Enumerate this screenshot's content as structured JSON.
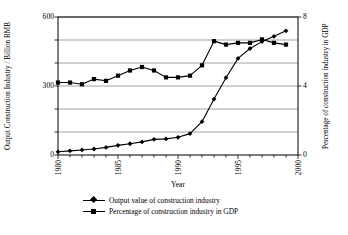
{
  "chart_data": {
    "type": "line",
    "title": "",
    "xlabel": "Year",
    "ylabel": "Output Construction Industry / Billion RMB",
    "ylabel_right": "Percentage of construction industry in GDP",
    "grid": true,
    "legend_position": "bottom",
    "xlim": [
      1980,
      2000
    ],
    "xticks": [
      1980,
      1985,
      1990,
      1995,
      2000
    ],
    "xtick_labels": [
      "1980",
      "1985",
      "1990",
      "1995",
      "2000"
    ],
    "ylim": [
      0,
      600
    ],
    "yticks": [
      0,
      100,
      200,
      300,
      400,
      500,
      600
    ],
    "ytick_labels": [
      "0",
      "",
      "",
      "300",
      "",
      "",
      "600"
    ],
    "ylim_right": [
      0,
      8
    ],
    "yticks_right": [
      0,
      4,
      8
    ],
    "ytick_labels_right": [
      "0",
      "4",
      "8"
    ],
    "x": [
      1980,
      1981,
      1982,
      1983,
      1984,
      1985,
      1986,
      1987,
      1988,
      1989,
      1990,
      1991,
      1992,
      1993,
      1994,
      1995,
      1996,
      1997,
      1998,
      1999
    ],
    "series": [
      {
        "name": "Output value of construction industry",
        "axis": "left",
        "marker": "diamond",
        "units": "Billion RMB",
        "values": [
          14,
          18,
          22,
          26,
          33,
          42,
          49,
          57,
          68,
          70,
          77,
          93,
          145,
          243,
          336,
          420,
          463,
          493,
          516,
          540
        ]
      },
      {
        "name": "Percentage of construction industry in GDP",
        "axis": "right",
        "marker": "square",
        "units": "percent",
        "values": [
          4.2,
          4.2,
          4.1,
          4.4,
          4.3,
          4.6,
          4.9,
          5.1,
          4.9,
          4.5,
          4.5,
          4.6,
          5.2,
          6.6,
          6.4,
          6.5,
          6.5,
          6.7,
          6.5,
          6.4
        ]
      }
    ],
    "legend": [
      "Output value of construction industry",
      "Percentage of construction industry in GDP"
    ]
  }
}
